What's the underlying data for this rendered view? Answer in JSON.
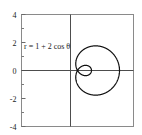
{
  "chart_data": {
    "type": "line",
    "title": "",
    "subtitle": "",
    "xlabel": "",
    "ylabel": "",
    "xlim": [
      -4,
      4
    ],
    "ylim": [
      -4,
      4
    ],
    "grid": false,
    "legend": null,
    "annotations": [
      {
        "name": "equation-label",
        "text": "r = 1 + 2 cos θ",
        "x": -3.1,
        "y": 1.55
      }
    ],
    "axes": {
      "x_axis_line": true,
      "y_axis_line": true,
      "y_tick_labels": [
        "4",
        "2",
        "0",
        "-2",
        "-4"
      ],
      "y_tick_values": [
        4,
        2,
        0,
        -2,
        -4
      ],
      "y_minor_tick_values": [
        3,
        1,
        -1,
        -3
      ],
      "x_tick_labels": [],
      "x_tick_values": [],
      "frame": true,
      "frame_color": "#808080",
      "axis_color": "#4d4d4d"
    },
    "series": [
      {
        "name": "limacon",
        "equation": "r = 1 + 2 cos(theta)",
        "curve_color": "#111111",
        "line_width": 1.2,
        "theta_range_deg": [
          0,
          360
        ],
        "features": {
          "outer_loop_max_r": 3,
          "inner_loop_max_r": 1,
          "r_zero_angles_deg": [
            120,
            240
          ],
          "x_at_theta_0": 3,
          "x_at_theta_180": -1,
          "max_y": 1.76,
          "min_y": -1.76
        },
        "points_polar": [
          {
            "theta_deg": 0,
            "r": 3.0
          },
          {
            "theta_deg": 10,
            "r": 2.97
          },
          {
            "theta_deg": 20,
            "r": 2.88
          },
          {
            "theta_deg": 30,
            "r": 2.73
          },
          {
            "theta_deg": 40,
            "r": 2.53
          },
          {
            "theta_deg": 50,
            "r": 2.29
          },
          {
            "theta_deg": 60,
            "r": 2.0
          },
          {
            "theta_deg": 70,
            "r": 1.68
          },
          {
            "theta_deg": 80,
            "r": 1.35
          },
          {
            "theta_deg": 90,
            "r": 1.0
          },
          {
            "theta_deg": 100,
            "r": 0.65
          },
          {
            "theta_deg": 110,
            "r": 0.32
          },
          {
            "theta_deg": 120,
            "r": 0.0
          },
          {
            "theta_deg": 130,
            "r": -0.29
          },
          {
            "theta_deg": 140,
            "r": -0.53
          },
          {
            "theta_deg": 150,
            "r": -0.73
          },
          {
            "theta_deg": 160,
            "r": -0.88
          },
          {
            "theta_deg": 170,
            "r": -0.97
          },
          {
            "theta_deg": 180,
            "r": -1.0
          },
          {
            "theta_deg": 190,
            "r": -0.97
          },
          {
            "theta_deg": 200,
            "r": -0.88
          },
          {
            "theta_deg": 210,
            "r": -0.73
          },
          {
            "theta_deg": 220,
            "r": -0.53
          },
          {
            "theta_deg": 230,
            "r": -0.29
          },
          {
            "theta_deg": 240,
            "r": 0.0
          },
          {
            "theta_deg": 250,
            "r": 0.32
          },
          {
            "theta_deg": 260,
            "r": 0.65
          },
          {
            "theta_deg": 270,
            "r": 1.0
          },
          {
            "theta_deg": 280,
            "r": 1.35
          },
          {
            "theta_deg": 290,
            "r": 1.68
          },
          {
            "theta_deg": 300,
            "r": 2.0
          },
          {
            "theta_deg": 310,
            "r": 2.29
          },
          {
            "theta_deg": 320,
            "r": 2.53
          },
          {
            "theta_deg": 330,
            "r": 2.73
          },
          {
            "theta_deg": 340,
            "r": 2.88
          },
          {
            "theta_deg": 350,
            "r": 2.97
          },
          {
            "theta_deg": 360,
            "r": 3.0
          }
        ]
      }
    ]
  }
}
